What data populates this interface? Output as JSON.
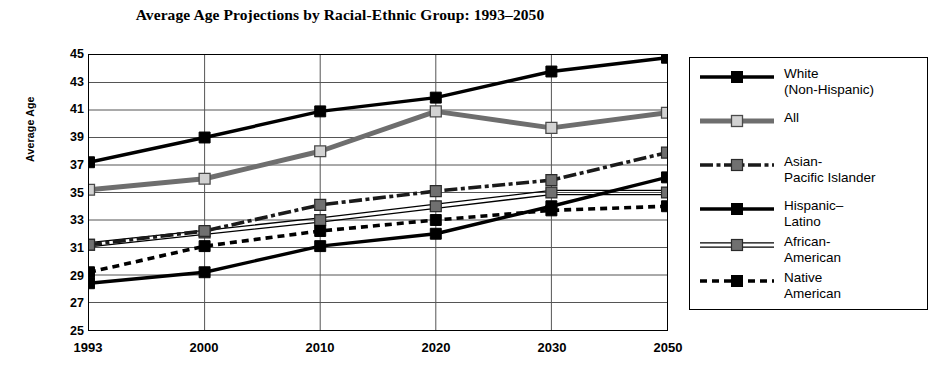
{
  "chart_data": {
    "type": "line",
    "title": "Average Age Projections by Racial-Ethnic Group: 1993–2050",
    "xlabel": "",
    "ylabel": "Average Age",
    "categories": [
      "1993",
      "2000",
      "2010",
      "2020",
      "2030",
      "2050"
    ],
    "ylim": [
      25,
      45
    ],
    "yticks": [
      "45",
      "43",
      "41",
      "39",
      "37",
      "35",
      "33",
      "31",
      "29",
      "27",
      "25"
    ],
    "ytick_step": 2,
    "grid": true,
    "legend_position": "right",
    "series": [
      {
        "name": "White\n(Non-Hispanic)",
        "key": "white_non_hispanic",
        "values": [
          37.2,
          39.0,
          40.9,
          41.9,
          43.8,
          44.8
        ],
        "line_style": "solid",
        "color": "#000000",
        "marker": "filled-square"
      },
      {
        "name": "All",
        "key": "all",
        "values": [
          35.2,
          36.0,
          38.0,
          40.9,
          39.7,
          40.8
        ],
        "line_style": "solid-thick-gray",
        "color": "#6e6e6e",
        "marker": "light-square"
      },
      {
        "name": "Asian-\nPacific Islander",
        "key": "asian_pacific_islander",
        "values": [
          31.2,
          32.2,
          34.1,
          35.1,
          35.9,
          37.9
        ],
        "line_style": "dash-dot",
        "color": "#1a1a1a",
        "marker": "gray-square"
      },
      {
        "name": "Hispanic–\nLatino",
        "key": "hispanic_latino",
        "values": [
          28.4,
          29.2,
          31.1,
          32.0,
          34.0,
          36.1
        ],
        "line_style": "solid",
        "color": "#000000",
        "marker": "filled-square"
      },
      {
        "name": "African-\nAmerican",
        "key": "african_american",
        "values": [
          31.2,
          32.1,
          33.0,
          34.0,
          35.0,
          35.0
        ],
        "line_style": "double-thin",
        "color": "#000000",
        "marker": "gray-square"
      },
      {
        "name": "Native\nAmerican",
        "key": "native_american",
        "values": [
          29.2,
          31.1,
          32.2,
          33.0,
          33.7,
          34.0
        ],
        "line_style": "dashed",
        "color": "#000000",
        "marker": "filled-square"
      }
    ]
  }
}
